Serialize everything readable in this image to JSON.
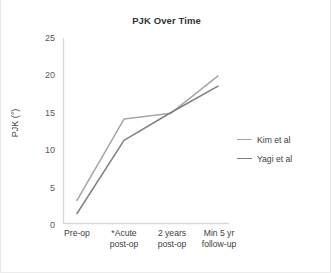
{
  "chart_data": {
    "type": "line",
    "title": "PJK Over Time",
    "xlabel": "",
    "ylabel": "PJK (°)",
    "categories": [
      "Pre-op",
      "*Acute post-op",
      "2 years post-op",
      "Min 5 yr follow-up"
    ],
    "category_lines": [
      [
        "Pre-op"
      ],
      [
        "*Acute",
        "post-op"
      ],
      [
        "2 years",
        "post-op"
      ],
      [
        "Min 5 yr",
        "follow-up"
      ]
    ],
    "ylim": [
      0,
      25
    ],
    "yticks": [
      0,
      5,
      10,
      15,
      20,
      25
    ],
    "grid": false,
    "legend_position": "right",
    "series": [
      {
        "name": "Kim et al",
        "color": "#a6a6a6",
        "values": [
          3.1,
          14.2,
          15.0,
          20.1
        ]
      },
      {
        "name": "Yagi et al",
        "color": "#808080",
        "values": [
          1.3,
          11.3,
          15.1,
          18.7
        ]
      }
    ]
  },
  "colors": {
    "axis": "#d9d9d9",
    "title_text": "#333333",
    "tick_text": "#595959",
    "label_text": "#404040",
    "background": "#ffffff",
    "figure_border": "#e8e8e8"
  }
}
